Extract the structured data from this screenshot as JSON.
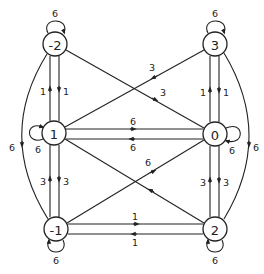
{
  "diagram": {
    "type": "directed-weighted-graph",
    "nodes": [
      {
        "id": "n_m2",
        "label": "-2",
        "x": 55,
        "y": 44
      },
      {
        "id": "n_3",
        "label": "3",
        "x": 215,
        "y": 44
      },
      {
        "id": "n_1",
        "label": "1",
        "x": 54,
        "y": 133
      },
      {
        "id": "n_0",
        "label": "0",
        "x": 215,
        "y": 134
      },
      {
        "id": "n_m1",
        "label": "-1",
        "x": 56,
        "y": 229
      },
      {
        "id": "n_2",
        "label": "2",
        "x": 215,
        "y": 229
      }
    ],
    "edges": [
      {
        "from": "-2",
        "to": "-2",
        "weight": "6"
      },
      {
        "from": "3",
        "to": "3",
        "weight": "6"
      },
      {
        "from": "1",
        "to": "1",
        "weight": "6"
      },
      {
        "from": "0",
        "to": "0",
        "weight": "6"
      },
      {
        "from": "-1",
        "to": "-1",
        "weight": "6"
      },
      {
        "from": "2",
        "to": "2",
        "weight": "6"
      },
      {
        "from": "1",
        "to": "-2",
        "weight": "1"
      },
      {
        "from": "-2",
        "to": "1",
        "weight": "1"
      },
      {
        "from": "0",
        "to": "3",
        "weight": "1"
      },
      {
        "from": "3",
        "to": "0",
        "weight": "1"
      },
      {
        "from": "-1",
        "to": "1",
        "weight": "3"
      },
      {
        "from": "1",
        "to": "-1",
        "weight": "3"
      },
      {
        "from": "2",
        "to": "0",
        "weight": "3"
      },
      {
        "from": "0",
        "to": "2",
        "weight": "3"
      },
      {
        "from": "1",
        "to": "0",
        "weight": "6"
      },
      {
        "from": "0",
        "to": "1",
        "weight": "6"
      },
      {
        "from": "-1",
        "to": "2",
        "weight": "1"
      },
      {
        "from": "2",
        "to": "-1",
        "weight": "1"
      },
      {
        "from": "3",
        "to": "1",
        "weight": "3"
      },
      {
        "from": "-2",
        "to": "0",
        "weight": "3"
      },
      {
        "from": "-1",
        "to": "0",
        "weight": "6"
      },
      {
        "from": "2",
        "to": "1",
        "weight": "6"
      },
      {
        "from": "-2",
        "to": "-1",
        "weight": "6"
      },
      {
        "from": "3",
        "to": "2",
        "weight": "6"
      }
    ],
    "labels": {
      "loop_m2": "6",
      "loop_3": "6",
      "loop_1": "6",
      "loop_0": "6",
      "loop_m1": "6",
      "loop_2": "6",
      "e_1_m2": "1",
      "e_m2_1": "1",
      "e_0_3": "1",
      "e_3_0": "1",
      "e_m1_1": "3",
      "e_1_m1": "3",
      "e_2_0": "3",
      "e_0_2": "3",
      "e_1_0": "6",
      "e_0_1": "6",
      "e_m1_2": "1",
      "e_2_m1": "1",
      "e_3_1": "3",
      "e_m2_0": "3",
      "e_m1_0": "6",
      "e_2_1": "6",
      "e_m2_m1": "6",
      "e_3_2": "6",
      "node_m2": "-2",
      "node_3": "3",
      "node_1": "1",
      "node_0": "0",
      "node_m1": "-1",
      "node_2": "2"
    },
    "colors": {
      "stroke": "#222222",
      "background": "#ffffff"
    }
  }
}
